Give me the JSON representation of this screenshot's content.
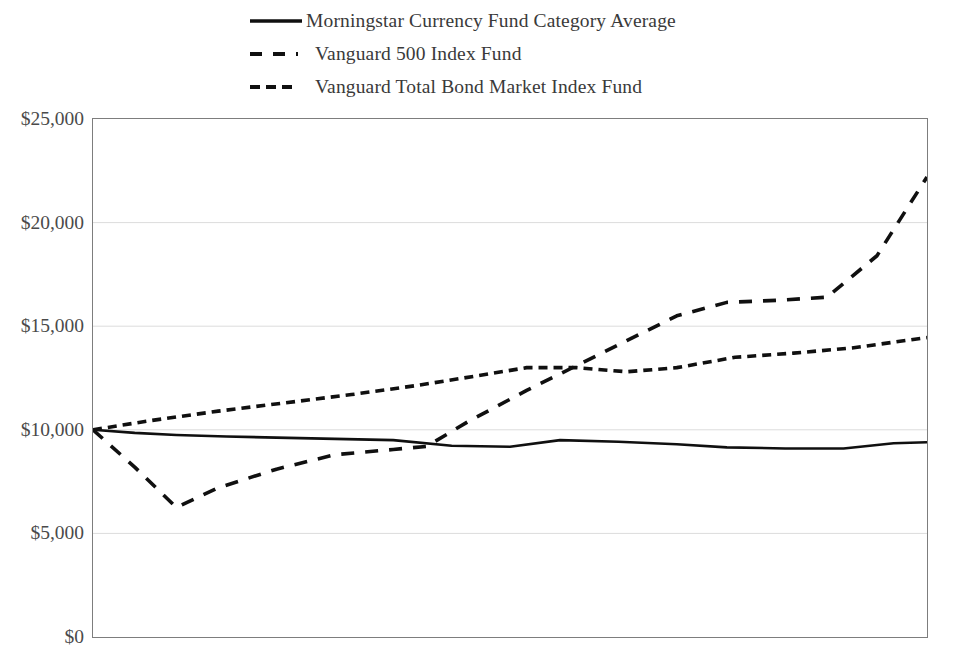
{
  "chart_data": {
    "type": "line",
    "title": "",
    "subtitle": "",
    "xlabel": "",
    "ylabel": "",
    "ylim": [
      0,
      25000
    ],
    "ytick_labels": [
      "$0",
      "$5,000",
      "$10,000",
      "$15,000",
      "$20,000",
      "$25,000"
    ],
    "ytick_values": [
      0,
      5000,
      10000,
      15000,
      20000,
      25000
    ],
    "xtick_labels": [],
    "xlim": [
      0,
      10
    ],
    "grid": "horizontal",
    "legend_position": "top",
    "line_color": "#101010",
    "grid_color": "#dcdcdc",
    "axis_color": "#7d7d7d",
    "series": [
      {
        "name": "Morningstar Currency Fund Category Average",
        "style": "solid",
        "x": [
          0.0,
          0.5,
          1.0,
          1.6,
          2.2,
          2.9,
          3.6,
          4.3,
          5.0,
          5.6,
          6.3,
          7.0,
          7.6,
          8.3,
          9.0,
          9.6,
          10.0
        ],
        "values": [
          10000,
          9850,
          9750,
          9680,
          9620,
          9560,
          9500,
          9230,
          9180,
          9500,
          9420,
          9300,
          9150,
          9100,
          9100,
          9350,
          9400
        ]
      },
      {
        "name": "Vanguard 500 Index Fund",
        "style": "dashed-long",
        "x": [
          0.0,
          0.5,
          1.0,
          1.5,
          2.2,
          2.9,
          3.6,
          4.0,
          4.5,
          5.2,
          5.8,
          6.4,
          7.0,
          7.6,
          8.2,
          8.8,
          9.4,
          10.0
        ],
        "values": [
          10000,
          8200,
          6250,
          7200,
          8100,
          8800,
          9050,
          9200,
          10400,
          11900,
          13100,
          14300,
          15500,
          16150,
          16250,
          16400,
          18400,
          22200
        ]
      },
      {
        "name": "Vanguard Total Bond Market Index Fund",
        "style": "dashed-short",
        "x": [
          0.0,
          0.7,
          1.5,
          2.3,
          3.1,
          3.9,
          4.6,
          5.2,
          5.8,
          6.4,
          7.0,
          7.7,
          8.4,
          9.1,
          10.0
        ],
        "values": [
          10000,
          10450,
          10900,
          11300,
          11700,
          12150,
          12600,
          13000,
          13000,
          12800,
          13000,
          13500,
          13700,
          13950,
          14450
        ]
      }
    ]
  },
  "legend": {
    "items": [
      {
        "label": "Morningstar Currency Fund Category Average",
        "style": "solid"
      },
      {
        "label": "Vanguard 500 Index Fund",
        "style": "dashed-long"
      },
      {
        "label": "Vanguard Total Bond Market Index Fund",
        "style": "dashed-short"
      }
    ]
  }
}
